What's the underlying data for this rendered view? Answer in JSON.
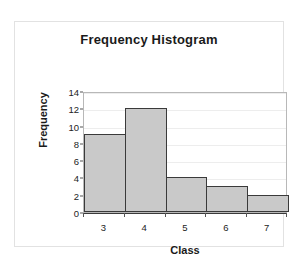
{
  "chart_data": {
    "type": "bar",
    "title": "Frequency Histogram",
    "xlabel": "Class",
    "ylabel": "Frequency",
    "categories": [
      "3",
      "4",
      "5",
      "6",
      "7"
    ],
    "values": [
      9,
      12,
      4,
      3,
      2
    ],
    "ylim": [
      0,
      14
    ],
    "yticks": [
      0,
      2,
      4,
      6,
      8,
      10,
      12,
      14
    ],
    "ytick_labels": [
      "0",
      "2",
      "4",
      "6",
      "8",
      "10",
      "12",
      "14"
    ],
    "grid": true,
    "grid_axis": "y",
    "legend": false,
    "bar_fill_color": "#c9c9c9",
    "bar_edge_color": "#3a3a3a",
    "plot_border_color": "#b8b8b8",
    "gridline_color": "#ededed",
    "frame_color": "#e2e2e2",
    "background_color": "#ffffff",
    "text_color": "#1a1a1a"
  }
}
